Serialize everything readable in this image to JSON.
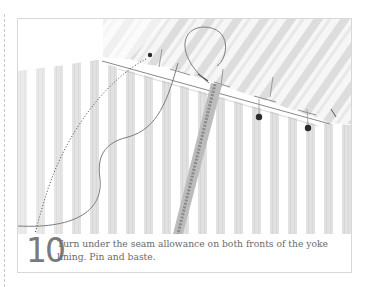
{
  "step": {
    "number": "10",
    "text": "Turn under the seam allowance on both fronts of the yoke lining. Pin and baste."
  },
  "illustration": {
    "subject": "fabric yoke lining with seam allowance turned under, pinned and basted with needle and thread",
    "elements": [
      "striped-fabric",
      "yoke-fold",
      "basting-stitches",
      "pins",
      "needle-and-thread",
      "zipper-tape",
      "dotted-guide-line"
    ]
  },
  "colors": {
    "frame": "#d8d8d8",
    "stripe": "#d4d4d4",
    "thread": "#7d7d7d",
    "text": "#6a6a6a",
    "number": "#7a7a7a"
  }
}
